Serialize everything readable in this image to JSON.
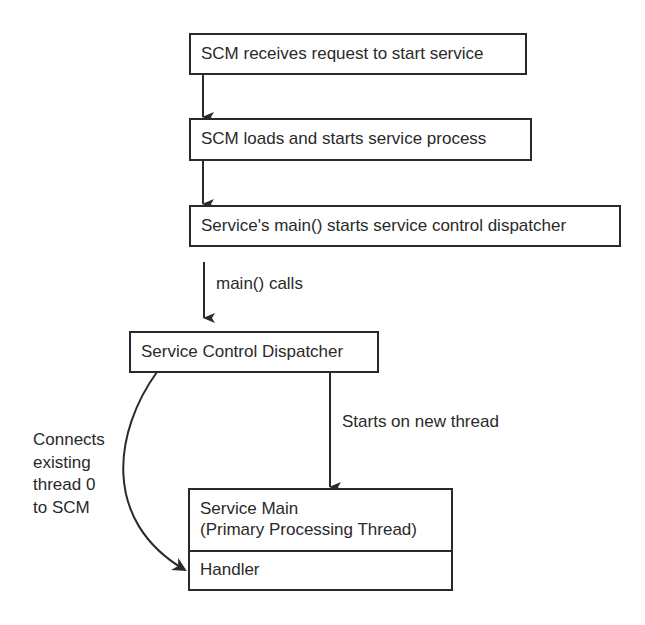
{
  "diagram": {
    "steps": [
      {
        "id": "step1",
        "label": "SCM receives request to start service"
      },
      {
        "id": "step2",
        "label": "SCM loads and starts service process"
      },
      {
        "id": "step3",
        "label": "Service's main() starts service control dispatcher"
      }
    ],
    "dispatcher": {
      "label": "Service Control Dispatcher"
    },
    "service_main": {
      "line1": "Service Main",
      "line2": "(Primary Processing Thread)",
      "handler": "Handler"
    },
    "edge_labels": {
      "main_calls": "main() calls",
      "starts_on_new_thread": "Starts on new thread",
      "connects": [
        "Connects",
        "existing",
        "thread 0",
        "to SCM"
      ]
    },
    "colors": {
      "stroke": "#2a2a2a",
      "background": "#ffffff"
    }
  }
}
